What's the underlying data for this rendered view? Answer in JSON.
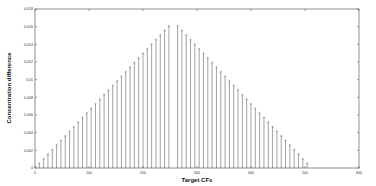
{
  "chart_data": {
    "type": "stem",
    "title": "",
    "xlabel": "Target CFs",
    "ylabel": "Concentration difference",
    "xlim": [
      0,
      600
    ],
    "ylim": [
      0,
      0.018
    ],
    "xticks": [
      0,
      100,
      200,
      300,
      400,
      500,
      600
    ],
    "yticks": [
      0,
      0.002,
      0.004,
      0.006,
      0.008,
      0.01,
      0.012,
      0.014,
      0.016,
      0.018
    ],
    "ytick_labels": [
      "0",
      "0.002",
      "0.004",
      "0.006",
      "0.008",
      "0.01",
      "0.012",
      "0.014",
      "0.016",
      "0.018"
    ],
    "grid": false,
    "legend": null,
    "series": [
      {
        "name": "difference",
        "color": "#555555",
        "x_start": 8,
        "x_step": 8,
        "x_end": 504,
        "peak_x": 256,
        "peak_value": 0.0166,
        "shape": "triangular: rises linearly from ~0 at x=0 to ~0.0166 near x=256, then falls linearly to ~0 near x=512"
      }
    ]
  }
}
